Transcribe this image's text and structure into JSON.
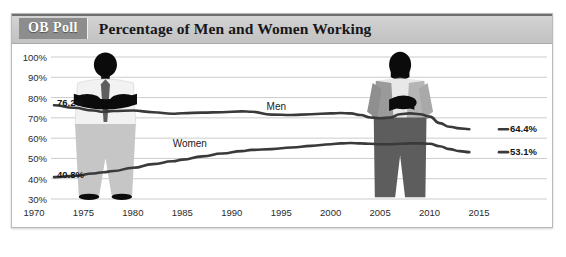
{
  "header": {
    "badge": "OB Poll",
    "title": "Percentage of Men and Women Working"
  },
  "source_note": "",
  "figures": {
    "man": "man-illustration",
    "woman": "woman-illustration"
  },
  "chart_data": {
    "type": "line",
    "title": "Percentage of Men and Women Working",
    "xlabel": "",
    "ylabel": "",
    "xlim": [
      1970,
      2015
    ],
    "ylim": [
      30,
      100
    ],
    "ytick_format": "percent",
    "grid": true,
    "legend": "inline-labels",
    "yticks": [
      "100%",
      "90%",
      "80%",
      "70%",
      "60%",
      "50%",
      "40%",
      "30%"
    ],
    "ytick_values": [
      100,
      90,
      80,
      70,
      60,
      50,
      40,
      30
    ],
    "xticks": [
      "1970",
      "1975",
      "1980",
      "1985",
      "1990",
      "1995",
      "2000",
      "2005",
      "2010",
      "2015"
    ],
    "xtick_values": [
      1970,
      1975,
      1980,
      1985,
      1990,
      1995,
      2000,
      2005,
      2010,
      2015
    ],
    "x": [
      1970,
      1972,
      1974,
      1975,
      1976,
      1978,
      1980,
      1982,
      1983,
      1985,
      1987,
      1989,
      1990,
      1992,
      1994,
      1996,
      1998,
      1999,
      2000,
      2001,
      2002,
      2003,
      2004,
      2005,
      2006,
      2007,
      2008,
      2009,
      2010,
      2011,
      2012
    ],
    "series": [
      {
        "name": "Men",
        "label_start": "76.2%",
        "label_end": "64.4%",
        "color": "#3a3a3a",
        "values": [
          76.2,
          75.0,
          73.6,
          73.0,
          73.4,
          73.6,
          72.8,
          72.0,
          72.3,
          72.6,
          72.8,
          73.2,
          73.0,
          71.6,
          71.4,
          71.8,
          72.2,
          72.4,
          72.2,
          71.4,
          70.2,
          69.8,
          70.2,
          71.8,
          72.2,
          71.8,
          70.6,
          67.4,
          65.6,
          64.8,
          64.4
        ]
      },
      {
        "name": "Women",
        "label_start": "40.8%",
        "label_end": "53.1%",
        "color": "#3a3a3a",
        "values": [
          40.8,
          41.4,
          42.6,
          43.2,
          43.8,
          45.4,
          47.2,
          48.6,
          49.4,
          51.0,
          52.4,
          53.6,
          54.2,
          54.6,
          55.4,
          56.2,
          57.0,
          57.4,
          57.6,
          57.4,
          57.2,
          57.0,
          57.0,
          57.2,
          57.4,
          57.4,
          57.2,
          56.0,
          54.6,
          53.6,
          53.1
        ]
      }
    ],
    "annotations": [
      {
        "text": "Men",
        "x": 1993,
        "y": 76.5
      },
      {
        "text": "Women",
        "x": 1984,
        "y": 58.5
      },
      {
        "text": "76.2%",
        "x": 1970,
        "y": 78.5
      },
      {
        "text": "40.8%",
        "x": 1970,
        "y": 43.5
      },
      {
        "text": "64.4%",
        "x": 2013,
        "y": 64.4
      },
      {
        "text": "53.1%",
        "x": 2013,
        "y": 53.1
      }
    ]
  }
}
